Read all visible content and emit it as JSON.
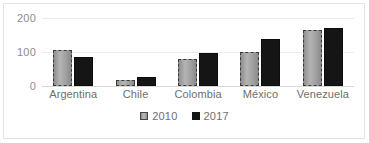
{
  "chart_data": {
    "type": "bar",
    "title": "",
    "xlabel": "",
    "ylabel": "",
    "categories": [
      "Argentina",
      "Chile",
      "Colombia",
      "México",
      "Venezuela"
    ],
    "series": [
      {
        "name": "2010",
        "values": [
          105,
          18,
          80,
          100,
          165
        ]
      },
      {
        "name": "2017",
        "values": [
          85,
          27,
          98,
          137,
          172
        ]
      }
    ],
    "ylim": [
      0,
      200
    ],
    "yticks": [
      0,
      100,
      200
    ],
    "ytick_labels": [
      "0",
      "100",
      "200"
    ],
    "grid": true,
    "legend_position": "bottom",
    "colors": {
      "series_2010": "#a8a8a8",
      "series_2017": "#151515",
      "gridline": "#eceded",
      "axis": "#d6d7d8",
      "text": "#6e6e6e",
      "frame": "#e3e3e3",
      "background": "#ffffff"
    }
  },
  "legend": {
    "items": [
      {
        "label": "2010",
        "swatch": "legend-swatch-2010"
      },
      {
        "label": "2017",
        "swatch": "legend-swatch-2017"
      }
    ]
  }
}
